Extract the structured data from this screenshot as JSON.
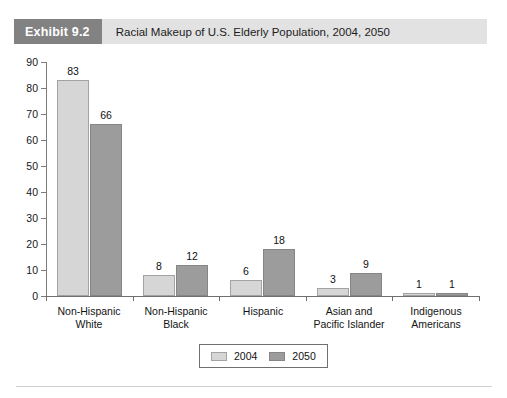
{
  "header": {
    "exhibit_tag": "Exhibit 9.2",
    "title": "Racial Makeup of U.S. Elderly Population, 2004, 2050",
    "tag_bg": "#828282",
    "band_bg": "#e2e2e2"
  },
  "legend": {
    "items": [
      {
        "label": "2004",
        "color": "#d6d6d6",
        "swatch_name": "legend-swatch-2004"
      },
      {
        "label": "2050",
        "color": "#9c9c9c",
        "swatch_name": "legend-swatch-2050"
      }
    ]
  },
  "chart_data": {
    "type": "bar",
    "title": "Racial Makeup of U.S. Elderly Population, 2004, 2050",
    "xlabel": "",
    "ylabel": "",
    "ylim": [
      0,
      90
    ],
    "yticks": [
      0,
      10,
      20,
      30,
      40,
      50,
      60,
      70,
      80,
      90
    ],
    "ytick_labels": [
      "0",
      "10",
      "20",
      "30",
      "40",
      "50",
      "60",
      "70",
      "80",
      "90"
    ],
    "grid": false,
    "legend_position": "bottom-center",
    "categories": [
      "Non-Hispanic White",
      "Non-Hispanic Black",
      "Hispanic",
      "Asian and Pacific Islander",
      "Indigenous Americans"
    ],
    "category_lines": [
      [
        "Non-Hispanic",
        "White"
      ],
      [
        "Non-Hispanic",
        "Black"
      ],
      [
        "Hispanic",
        ""
      ],
      [
        "Asian and",
        "Pacific Islander"
      ],
      [
        "Indigenous",
        "Americans"
      ]
    ],
    "series": [
      {
        "name": "2004",
        "color": "#d6d6d6",
        "values": [
          83,
          8,
          6,
          3,
          1
        ]
      },
      {
        "name": "2050",
        "color": "#9c9c9c",
        "values": [
          66,
          12,
          18,
          9,
          1
        ]
      }
    ]
  }
}
